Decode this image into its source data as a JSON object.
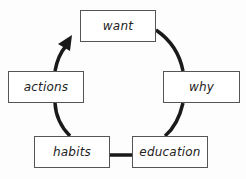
{
  "diagram": {
    "type": "cycle",
    "nodes": [
      {
        "id": "want",
        "label": "want"
      },
      {
        "id": "why",
        "label": "why"
      },
      {
        "id": "education",
        "label": "education"
      },
      {
        "id": "habits",
        "label": "habits"
      },
      {
        "id": "actions",
        "label": "actions"
      }
    ],
    "edges": [
      {
        "from": "want",
        "to": "why"
      },
      {
        "from": "why",
        "to": "education"
      },
      {
        "from": "education",
        "to": "habits"
      },
      {
        "from": "habits",
        "to": "actions"
      },
      {
        "from": "actions",
        "to": "want",
        "arrow": true
      }
    ],
    "colors": {
      "line": "#1a1a1a",
      "box_border": "#555555",
      "background": "#fdfdfd"
    }
  }
}
